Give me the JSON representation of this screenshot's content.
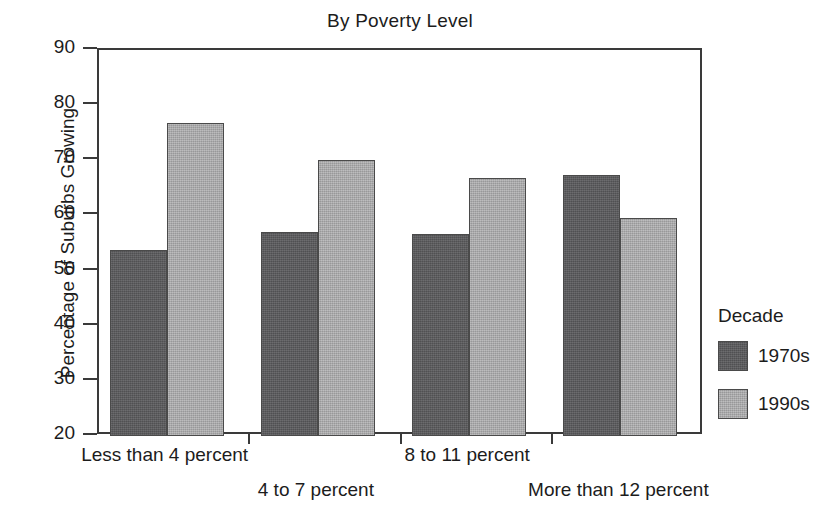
{
  "chart_data": {
    "type": "bar",
    "title": "By Poverty Level",
    "xlabel": "",
    "ylabel": "Percentage of Suburbs Growing",
    "ylim": [
      20,
      90
    ],
    "ytick_values": [
      20,
      30,
      40,
      50,
      60,
      70,
      80,
      90
    ],
    "ytick_labels": [
      "20",
      "30",
      "40",
      "50",
      "60",
      "70",
      "80",
      "90"
    ],
    "grid": false,
    "legend_position": "right",
    "legend_title": "Decade",
    "categories": [
      "Less than 4 percent",
      "4 to 7 percent",
      "8 to 11 percent",
      "More than 12 percent"
    ],
    "series": [
      {
        "name": "1970s",
        "color": "#59595b",
        "values": [
          53.8,
          57.0,
          56.6,
          67.4
        ]
      },
      {
        "name": "1990s",
        "color": "#a9a9aa",
        "values": [
          76.7,
          70.1,
          66.7,
          59.5
        ]
      }
    ]
  },
  "figure": {
    "background": "#ffffff",
    "axis_color": "#3a3a3a",
    "text_color": "#1c1c1c"
  }
}
